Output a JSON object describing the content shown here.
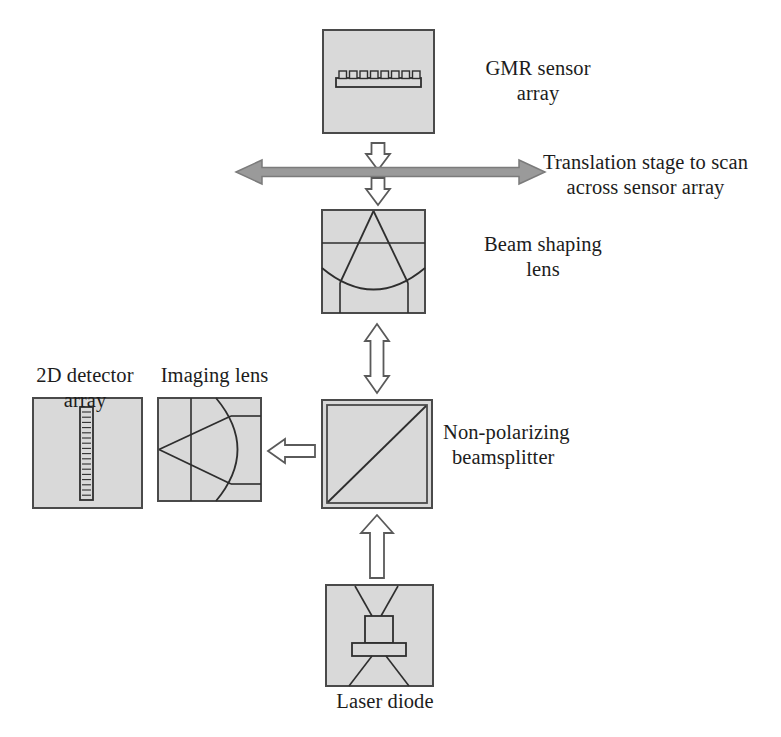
{
  "diagram": {
    "colors": {
      "box_fill": "#d9d9d9",
      "box_stroke": "#4a4a4a",
      "line": "#2e2e2e",
      "arrow_solid_fill": "#9a9a9a",
      "arrow_solid_stroke": "#6e6e6e",
      "arrow_open_fill": "#ffffff",
      "arrow_open_stroke": "#5a5a5a",
      "text": "#1c1c1c",
      "background": "#ffffff"
    },
    "labels": {
      "gmr_sensor_array": {
        "line1": "GMR sensor",
        "line2": "array"
      },
      "translation_stage": {
        "line1": "Translation stage to scan",
        "line2": "across sensor array"
      },
      "beam_shaping_lens": {
        "line1": "Beam shaping",
        "line2": "lens"
      },
      "detector_array": {
        "line1": "2D detector",
        "line2": "array"
      },
      "imaging_lens": {
        "line1": "Imaging lens",
        "line2": ""
      },
      "beamsplitter": {
        "line1": "Non-polarizing",
        "line2": "beamsplitter"
      },
      "laser_diode": {
        "line1": "Laser diode",
        "line2": ""
      }
    },
    "components": [
      {
        "name": "gmr-sensor-array",
        "label": "GMR sensor array",
        "x": 323,
        "y": 30,
        "w": 111,
        "h": 103,
        "sensor_elements": 8
      },
      {
        "name": "beam-shaping-lens",
        "label": "Beam shaping lens",
        "x": 322,
        "y": 210,
        "w": 103,
        "h": 103
      },
      {
        "name": "beamsplitter",
        "label": "Non-polarizing beamsplitter",
        "x": 322,
        "y": 400,
        "w": 110,
        "h": 108
      },
      {
        "name": "imaging-lens",
        "label": "Imaging lens",
        "x": 158,
        "y": 398,
        "w": 103,
        "h": 103
      },
      {
        "name": "detector-array",
        "label": "2D detector array",
        "x": 33,
        "y": 398,
        "w": 109,
        "h": 110,
        "detector_elements": 17
      },
      {
        "name": "laser-diode",
        "label": "Laser diode",
        "x": 326,
        "y": 585,
        "w": 107,
        "h": 101
      }
    ],
    "arrows": [
      {
        "name": "translation-stage-arrow",
        "style": "solid-gray",
        "direction": "both-horizontal"
      },
      {
        "name": "gmr-up-arrow",
        "style": "open-white",
        "direction": "up"
      },
      {
        "name": "stage-down-arrow",
        "style": "open-white",
        "direction": "down"
      },
      {
        "name": "lens-beamsplitter-arrow",
        "style": "open-white",
        "direction": "both-vertical"
      },
      {
        "name": "beamsplitter-imaging-arrow",
        "style": "open-white",
        "direction": "left"
      },
      {
        "name": "laser-beamsplitter-arrow",
        "style": "open-white",
        "direction": "up"
      }
    ]
  }
}
